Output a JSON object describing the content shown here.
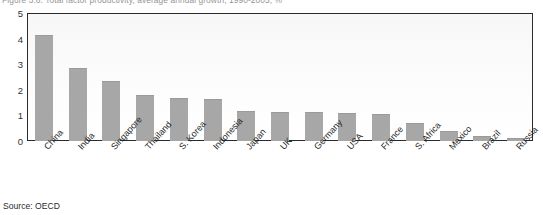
{
  "figure": {
    "title": "Figure 3.6: Total factor productivity, average annual growth, 1990-2005, %",
    "source": "Source: OECD"
  },
  "chart_data": {
    "type": "bar",
    "title": "Figure 3.6: Total factor productivity, average annual growth, 1990-2005, %",
    "xlabel": "",
    "ylabel": "",
    "ylim": [
      0,
      5
    ],
    "yticks": [
      0,
      1,
      2,
      3,
      4,
      5
    ],
    "grid": false,
    "legend": "none",
    "bar_color": "#a7a7a7",
    "categories": [
      "China",
      "India",
      "Singapore",
      "Thailand",
      "S. Korea",
      "Indonesia",
      "Japan",
      "UK",
      "Germany",
      "USA",
      "France",
      "S. Africa",
      "Mexico",
      "Brazil",
      "Russia"
    ],
    "values": [
      4.1,
      2.8,
      2.3,
      1.75,
      1.65,
      1.6,
      1.15,
      1.1,
      1.1,
      1.05,
      1.0,
      0.65,
      0.35,
      0.15,
      0.08
    ]
  }
}
